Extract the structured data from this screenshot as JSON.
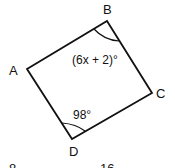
{
  "figure": {
    "type": "quadrilateral",
    "vertices": {
      "A": {
        "label": "A"
      },
      "B": {
        "label": "B"
      },
      "C": {
        "label": "C"
      },
      "D": {
        "label": "D"
      }
    },
    "angles": {
      "B": "(6x + 2)°",
      "D": "98°"
    }
  },
  "answer_choices_partial": [
    "8",
    "16"
  ]
}
